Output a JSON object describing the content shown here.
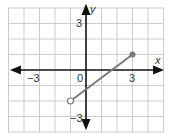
{
  "graph": {
    "x_axis_label": "x",
    "y_axis_label": "y",
    "origin_label": "0",
    "tick_labels": {
      "x_neg": "−3",
      "x_pos": "3",
      "y_pos": "3",
      "y_neg": "−3"
    },
    "grid": {
      "x_range": [
        -5,
        5
      ],
      "y_range": [
        -4,
        4
      ],
      "step": 1
    },
    "segment": {
      "start": {
        "x": -1,
        "y": -2,
        "endpoint": "open"
      },
      "end": {
        "x": 3,
        "y": 1,
        "endpoint": "closed"
      }
    },
    "colors": {
      "grid": "#cccccc",
      "axes": "#111111",
      "segment": "#7a7a7a",
      "closed_point": "#7a7a7a",
      "open_point_fill": "#ffffff"
    }
  }
}
